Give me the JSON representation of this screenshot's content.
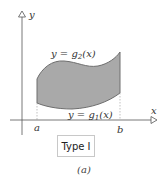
{
  "figure": {
    "axes": {
      "x_label": "x",
      "y_label": "y"
    },
    "ticks": {
      "a": "a",
      "b": "b"
    },
    "curves": {
      "upper": {
        "prefix": "y = g",
        "sub": "2",
        "suffix": "(x)"
      },
      "lower": {
        "prefix": "y = g",
        "sub": "1",
        "suffix": "(x)"
      }
    },
    "region_fill": "#a9a9a9",
    "region_stroke": "#6e6e6e",
    "type_label": "Type I",
    "caption": "(a)"
  }
}
